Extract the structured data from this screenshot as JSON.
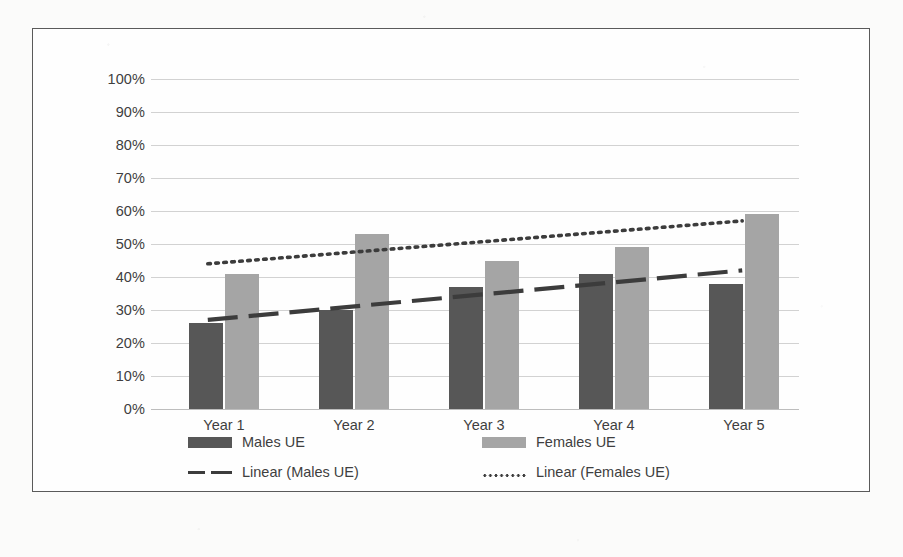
{
  "chart_data": {
    "type": "bar",
    "title": "",
    "xlabel": "",
    "ylabel": "",
    "categories": [
      "Year 1",
      "Year 2",
      "Year 3",
      "Year 4",
      "Year 5"
    ],
    "ylim": [
      0,
      100
    ],
    "ytick_labels": [
      "100%",
      "90%",
      "80%",
      "70%",
      "60%",
      "50%",
      "40%",
      "30%",
      "20%",
      "10%",
      "0%"
    ],
    "ytick_values": [
      100,
      90,
      80,
      70,
      60,
      50,
      40,
      30,
      20,
      10,
      0
    ],
    "grid": true,
    "legend_position": "bottom",
    "series": [
      {
        "name": "Males UE",
        "type": "bar",
        "color": "#575757",
        "values": [
          26,
          30,
          37,
          41,
          38
        ]
      },
      {
        "name": "Females UE",
        "type": "bar",
        "color": "#a5a5a5",
        "values": [
          41,
          53,
          45,
          49,
          59
        ]
      },
      {
        "name": "Linear (Males UE)",
        "type": "trendline",
        "style": "dashed",
        "color": "#3c3c3c",
        "start_value": 27,
        "end_value": 42
      },
      {
        "name": "Linear (Females UE)",
        "type": "trendline",
        "style": "dotted",
        "color": "#3c3c3c",
        "start_value": 44,
        "end_value": 57
      }
    ]
  },
  "axis": {
    "y_labels": {
      "t100": "100%",
      "t90": "90%",
      "t80": "80%",
      "t70": "70%",
      "t60": "60%",
      "t50": "50%",
      "t40": "40%",
      "t30": "30%",
      "t20": "20%",
      "t10": "10%",
      "t0": "0%"
    },
    "x_labels": {
      "c0": "Year 1",
      "c1": "Year 2",
      "c2": "Year 3",
      "c3": "Year 4",
      "c4": "Year 5"
    }
  },
  "legend": {
    "males_bar": "Males UE",
    "females_bar": "Females UE",
    "males_trend": "Linear (Males UE)",
    "females_trend": "Linear (Females UE)"
  },
  "colors": {
    "males_bar": "#575757",
    "females_bar": "#a5a5a5",
    "trendline": "#3c3c3c",
    "gridline": "#d2d2d2",
    "border": "#5a5a5a",
    "text": "#3f3f3f",
    "background": "#fefefe"
  }
}
